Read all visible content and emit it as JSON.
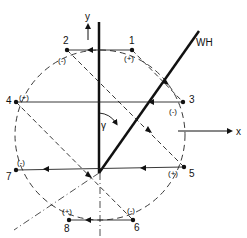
{
  "diagram": {
    "axes": {
      "y_label": "y",
      "x_label": "x",
      "line_label": "WH",
      "angle_label": "γ"
    },
    "points": [
      {
        "id": "1",
        "sign": "(+)"
      },
      {
        "id": "2",
        "sign": "(-)"
      },
      {
        "id": "3",
        "sign": "(-)"
      },
      {
        "id": "4",
        "sign": "(+)"
      },
      {
        "id": "5",
        "sign": "(+)"
      },
      {
        "id": "6",
        "sign": "(-)"
      },
      {
        "id": "7",
        "sign": "(-)"
      },
      {
        "id": "8",
        "sign": "(+)"
      }
    ]
  }
}
